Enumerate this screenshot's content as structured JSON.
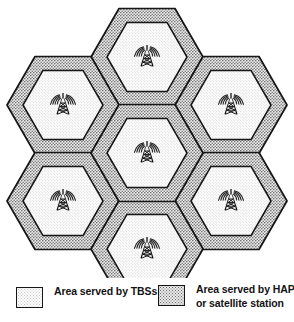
{
  "colors": {
    "outline": "#161616",
    "inner_fill": "#fdfdfd",
    "inner_dot": "#c9c9c9",
    "outer_fill": "#e8e8e8",
    "outer_dot": "#6f6f6f",
    "background": "#ffffff",
    "tower": "#111111"
  },
  "diagram": {
    "type": "hexagonal-cell-layout",
    "cell_count": 7,
    "cells": [
      {
        "id": "cell-top-center",
        "label": "Top centre cell",
        "cx": 147,
        "cy": 57,
        "icon": "cell-tower-icon"
      },
      {
        "id": "cell-upper-left",
        "label": "Upper left cell",
        "cx": 63,
        "cy": 105,
        "icon": "cell-tower-icon"
      },
      {
        "id": "cell-upper-right",
        "label": "Upper right cell",
        "cx": 231,
        "cy": 105,
        "icon": "cell-tower-icon"
      },
      {
        "id": "cell-center",
        "label": "Centre cell",
        "cx": 147,
        "cy": 153,
        "icon": "cell-tower-icon"
      },
      {
        "id": "cell-lower-left",
        "label": "Lower left cell",
        "cx": 63,
        "cy": 201,
        "icon": "cell-tower-icon"
      },
      {
        "id": "cell-lower-right",
        "label": "Lower right cell",
        "cx": 231,
        "cy": 201,
        "icon": "cell-tower-icon"
      },
      {
        "id": "cell-bottom-center",
        "label": "Bottom centre cell",
        "cx": 147,
        "cy": 249,
        "icon": "cell-tower-icon"
      }
    ],
    "outer_hex_radius": 56,
    "inner_hex_radius": 40,
    "orientation": "flat-top"
  },
  "legend": {
    "items": [
      {
        "key": "tbs",
        "swatch": "light-dotted",
        "lines": [
          "Area served by TBSs"
        ]
      },
      {
        "key": "hap",
        "swatch": "dark-dotted",
        "lines": [
          "Area served by HAPs",
          "or satellite station"
        ]
      }
    ],
    "tbs_line1": "Area served by TBSs",
    "hap_line1": "Area served by HAPs",
    "hap_line2": "or satellite station"
  }
}
